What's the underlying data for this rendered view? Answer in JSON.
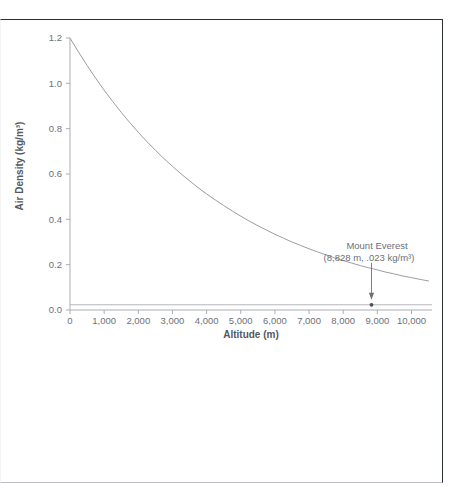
{
  "figure": {
    "border_color": "#2b2f36",
    "background": "#ffffff"
  },
  "chart_data": {
    "type": "line",
    "title": "",
    "subtitle": "",
    "xlabel": "Altitude (m)",
    "ylabel": "Air Density (kg/m³)",
    "xlim": [
      0,
      10600
    ],
    "ylim": [
      0,
      1.2
    ],
    "grid": false,
    "legend": null,
    "line_color": "#8d9198",
    "axis_color": "#a9adb3",
    "x_ticks": [
      0,
      1000,
      2000,
      3000,
      4000,
      5000,
      6000,
      7000,
      8000,
      9000,
      10000
    ],
    "x_tick_labels": [
      "0",
      "1,000",
      "2,000",
      "3,000",
      "4,000",
      "5,000",
      "6,000",
      "7,000",
      "8,000",
      "9,000",
      "10,000"
    ],
    "y_ticks": [
      0.0,
      0.2,
      0.4,
      0.6,
      0.8,
      1.0,
      1.2
    ],
    "y_tick_labels": [
      "0.0",
      "0.2",
      "0.4",
      "0.6",
      "0.8",
      "1.0",
      "1.2"
    ],
    "x": [
      0,
      250,
      500,
      750,
      1000,
      1250,
      1500,
      1750,
      2000,
      2250,
      2500,
      2750,
      3000,
      3250,
      3500,
      3750,
      4000,
      4250,
      4500,
      4750,
      5000,
      5250,
      5500,
      5750,
      6000,
      6250,
      6500,
      6750,
      7000,
      7250,
      7500,
      7750,
      8000,
      8250,
      8500,
      8750,
      9000,
      9250,
      9500,
      9750,
      10000,
      10250,
      10500
    ],
    "values": [
      1.2,
      1.138,
      1.079,
      1.023,
      0.97,
      0.92,
      0.872,
      0.827,
      0.784,
      0.743,
      0.705,
      0.668,
      0.634,
      0.601,
      0.57,
      0.54,
      0.512,
      0.486,
      0.461,
      0.437,
      0.414,
      0.392,
      0.372,
      0.353,
      0.334,
      0.317,
      0.3,
      0.285,
      0.27,
      0.256,
      0.243,
      0.23,
      0.218,
      0.207,
      0.196,
      0.186,
      0.177,
      0.167,
      0.159,
      0.15,
      0.143,
      0.135,
      0.128
    ],
    "reference_line": {
      "label": "Mount Everest density reference",
      "y_value": 0.023,
      "color": "#b4b7bc"
    },
    "annotations": [
      {
        "name": "mount-everest-annotation",
        "title": "Mount Everest",
        "value": "(8,828 m, .023 kg/m³)",
        "x": 8828,
        "y": 0.023,
        "marker": "point",
        "arrow": "down"
      }
    ]
  }
}
